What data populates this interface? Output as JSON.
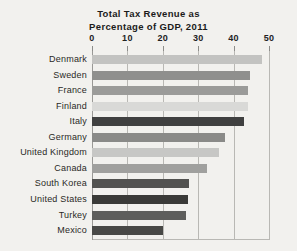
{
  "chart_data": {
    "type": "bar",
    "orientation": "horizontal",
    "title": "Total Tax Revenue as Percentage of GDP, 2011",
    "title_lines": [
      "Total Tax Revenue as",
      "Percentage of GDP, 2011"
    ],
    "xlabel": "",
    "ylabel": "",
    "xlim": [
      0,
      50
    ],
    "xticks": [
      0,
      10,
      20,
      30,
      40,
      50
    ],
    "xtick_labels": [
      "0",
      "10",
      "20",
      "30",
      "40",
      "50"
    ],
    "grid": "vertical",
    "legend": "none",
    "categories": [
      "Denmark",
      "Sweden",
      "France",
      "Finland",
      "Italy",
      "Germany",
      "United Kingdom",
      "Canada",
      "South Korea",
      "United States",
      "Turkey",
      "Mexico"
    ],
    "values": [
      48,
      44.5,
      44,
      44,
      43,
      37.5,
      36,
      32.5,
      27.5,
      27,
      26.5,
      20
    ],
    "bar_colors": [
      "#c3c3c1",
      "#8f8f8d",
      "#9b9b99",
      "#d9d9d7",
      "#404040",
      "#8a8a88",
      "#c7c7c5",
      "#a0a09e",
      "#525250",
      "#3a3a38",
      "#5e5e5c",
      "#484846"
    ]
  },
  "style": {
    "background": "#f2f1ee",
    "gridline_color": "#b9b8b4",
    "text_color": "#2a2926"
  }
}
